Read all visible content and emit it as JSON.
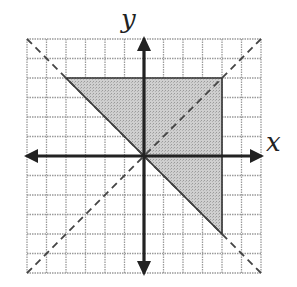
{
  "figure": {
    "x_axis_label": "x",
    "y_axis_label": "y",
    "grid_range": {
      "xmin": -6,
      "xmax": 6,
      "ymin": -6,
      "ymax": 6
    },
    "grid_step": 1,
    "shaded_region": {
      "shape": "triangle",
      "vertices": [
        [
          -4,
          4
        ],
        [
          4,
          4
        ],
        [
          4,
          -4
        ]
      ],
      "fill_color": "#c4c4c4",
      "edge_color": "#333333"
    },
    "dashed_lines": [
      {
        "equation": "y = x",
        "from": [
          -6,
          -6
        ],
        "to": [
          6,
          6
        ]
      },
      {
        "equation": "y = -x",
        "from": [
          -6,
          6
        ],
        "to": [
          6,
          -6
        ]
      }
    ],
    "colors": {
      "axis": "#222222",
      "grid": "#999999",
      "dash": "#444444"
    }
  }
}
